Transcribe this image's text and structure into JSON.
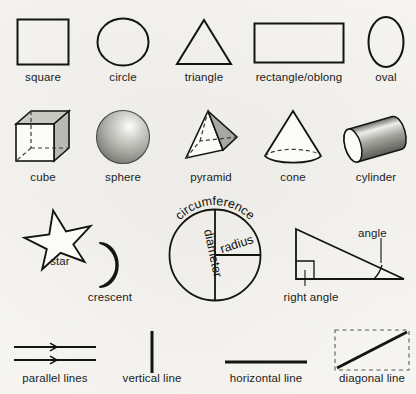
{
  "page": {
    "background_color": "#f6f5f2",
    "ink_color": "#15150f"
  },
  "rows": [
    {
      "name": "two-dimensional-shapes",
      "items": [
        {
          "key": "square",
          "label": "square",
          "icon": "square-shape"
        },
        {
          "key": "circle",
          "label": "circle",
          "icon": "circle-shape"
        },
        {
          "key": "triangle",
          "label": "triangle",
          "icon": "triangle-shape"
        },
        {
          "key": "rectangle",
          "label": "rectangle/oblong",
          "icon": "rectangle-shape"
        },
        {
          "key": "oval",
          "label": "oval",
          "icon": "oval-shape"
        }
      ]
    },
    {
      "name": "three-dimensional-solids",
      "items": [
        {
          "key": "cube",
          "label": "cube",
          "icon": "cube-solid"
        },
        {
          "key": "sphere",
          "label": "sphere",
          "icon": "sphere-solid"
        },
        {
          "key": "pyramid",
          "label": "pyramid",
          "icon": "pyramid-solid"
        },
        {
          "key": "cone",
          "label": "cone",
          "icon": "cone-solid"
        },
        {
          "key": "cylinder",
          "label": "cylinder",
          "icon": "cylinder-solid"
        }
      ]
    },
    {
      "name": "shapes-and-measurements",
      "items": [
        {
          "key": "star",
          "label": "star",
          "icon": "star-shape"
        },
        {
          "key": "crescent",
          "label": "crescent",
          "icon": "crescent-shape"
        },
        {
          "key": "circle_parts",
          "label": "",
          "icon": "circle-measurements-diagram"
        },
        {
          "key": "angles",
          "label": "",
          "icon": "right-triangle-angles-diagram"
        }
      ]
    },
    {
      "name": "lines",
      "items": [
        {
          "key": "parallel",
          "label": "parallel lines",
          "icon": "parallel-lines"
        },
        {
          "key": "vertical",
          "label": "vertical line",
          "icon": "vertical-line"
        },
        {
          "key": "horizontal",
          "label": "horizontal line",
          "icon": "horizontal-line"
        },
        {
          "key": "diagonal",
          "label": "diagonal line",
          "icon": "diagonal-line"
        }
      ]
    }
  ],
  "circle_diagram": {
    "circumference_label": "circumference",
    "diameter_label": "diameter",
    "radius_label": "radius"
  },
  "angle_diagram": {
    "angle_label": "angle",
    "right_angle_label": "right angle"
  }
}
